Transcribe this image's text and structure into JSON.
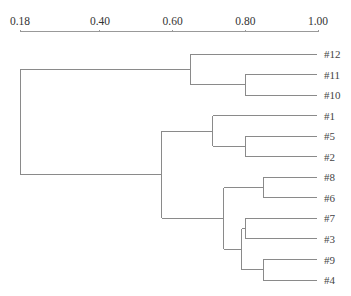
{
  "chart_data": {
    "type": "dendrogram",
    "title": "",
    "xlabel": "",
    "ylabel": "",
    "axis": {
      "position": "top",
      "ticks": [
        0.18,
        0.4,
        0.6,
        0.8,
        1.0
      ],
      "tick_labels": [
        "0.18",
        "0.40",
        "0.60",
        "0.80",
        "1.00"
      ],
      "range": [
        0.18,
        1.0
      ]
    },
    "grid": false,
    "legend": null,
    "leaves": [
      "#12",
      "#11",
      "#10",
      "#1",
      "#5",
      "#2",
      "#8",
      "#6",
      "#7",
      "#3",
      "#9",
      "#4"
    ],
    "merges": [
      {
        "id": "A",
        "children": [
          "#11",
          "#10"
        ],
        "similarity": 0.8
      },
      {
        "id": "B",
        "children": [
          "#12",
          "A"
        ],
        "similarity": 0.65
      },
      {
        "id": "C",
        "children": [
          "#5",
          "#2"
        ],
        "similarity": 0.8
      },
      {
        "id": "D",
        "children": [
          "#1",
          "C"
        ],
        "similarity": 0.71
      },
      {
        "id": "E",
        "children": [
          "#8",
          "#6"
        ],
        "similarity": 0.85
      },
      {
        "id": "F",
        "children": [
          "#7",
          "#3"
        ],
        "similarity": 0.8
      },
      {
        "id": "G",
        "children": [
          "#9",
          "#4"
        ],
        "similarity": 0.85
      },
      {
        "id": "H",
        "children": [
          "F",
          "G"
        ],
        "similarity": 0.79
      },
      {
        "id": "I",
        "children": [
          "E",
          "H"
        ],
        "similarity": 0.74
      },
      {
        "id": "J",
        "children": [
          "D",
          "I"
        ],
        "similarity": 0.57
      },
      {
        "id": "K",
        "children": [
          "B",
          "J"
        ],
        "similarity": 0.18
      }
    ]
  }
}
